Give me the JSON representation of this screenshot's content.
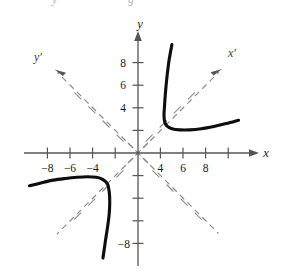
{
  "figure": {
    "title_fragment_left": "y",
    "title_fragment_right": "g"
  },
  "colors": {
    "curve": "#0d0d0d",
    "axis": "#555555",
    "dashed_axis": "#8c8c8c",
    "text": "#1a1a1a",
    "background": "#ffffff"
  },
  "axes": {
    "x_axis_label": "x",
    "y_axis_label": "y",
    "x_prime_label": "x′",
    "y_prime_label": "y′",
    "x_ticks": [
      {
        "value": -8,
        "label": "−8"
      },
      {
        "value": -6,
        "label": "−6"
      },
      {
        "value": -4,
        "label": "−4"
      },
      {
        "value": -2,
        "label": ""
      },
      {
        "value": 2,
        "label": ""
      },
      {
        "value": 4,
        "label": "4"
      },
      {
        "value": 6,
        "label": "6"
      },
      {
        "value": 8,
        "label": "8"
      }
    ],
    "y_ticks": [
      {
        "value": 8,
        "label": "8"
      },
      {
        "value": 6,
        "label": "6"
      },
      {
        "value": 4,
        "label": "4"
      },
      {
        "value": 2,
        "label": ""
      },
      {
        "value": -2,
        "label": ""
      },
      {
        "value": -4,
        "label": ""
      },
      {
        "value": -6,
        "label": ""
      },
      {
        "value": -8,
        "label": "−8"
      }
    ],
    "rotation_degrees": 45
  },
  "chart_data": {
    "type": "line",
    "title": "",
    "xlabel": "x",
    "ylabel": "y",
    "xlim": [
      -9.5,
      9.5
    ],
    "ylim": [
      -9.5,
      9.5
    ],
    "grid": false,
    "legend": false,
    "series": [
      {
        "name": "hyperbola-branch-upper-right",
        "points": [
          [
            3.0,
            9.6
          ],
          [
            2.75,
            8.2
          ],
          [
            2.55,
            6.6
          ],
          [
            2.42,
            5.2
          ],
          [
            2.35,
            4.2
          ],
          [
            2.3,
            3.3
          ],
          [
            2.38,
            2.7
          ],
          [
            2.6,
            2.35
          ],
          [
            3.0,
            2.15
          ],
          [
            3.7,
            2.05
          ],
          [
            4.6,
            2.05
          ],
          [
            5.6,
            2.15
          ],
          [
            6.7,
            2.35
          ],
          [
            7.8,
            2.6
          ],
          [
            8.9,
            2.9
          ]
        ]
      },
      {
        "name": "hyperbola-branch-lower-left",
        "points": [
          [
            -9.6,
            -2.9
          ],
          [
            -8.6,
            -2.65
          ],
          [
            -7.5,
            -2.4
          ],
          [
            -6.4,
            -2.25
          ],
          [
            -5.4,
            -2.15
          ],
          [
            -4.5,
            -2.1
          ],
          [
            -3.7,
            -2.15
          ],
          [
            -3.1,
            -2.35
          ],
          [
            -2.7,
            -2.75
          ],
          [
            -2.55,
            -3.4
          ],
          [
            -2.5,
            -4.3
          ],
          [
            -2.55,
            -5.4
          ],
          [
            -2.7,
            -6.6
          ],
          [
            -2.9,
            -7.9
          ],
          [
            -3.1,
            -9.3
          ]
        ]
      }
    ],
    "asymptote_axes": [
      {
        "name": "x-prime",
        "angle_degrees": 45,
        "dashed": true
      },
      {
        "name": "y-prime",
        "angle_degrees": 135,
        "dashed": true
      }
    ]
  }
}
